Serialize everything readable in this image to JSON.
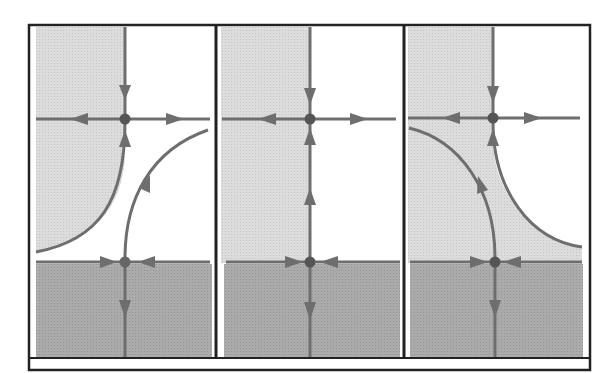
{
  "figure": {
    "type": "phase-portrait-panels",
    "panel_count": 3,
    "colors": {
      "background": "#ffffff",
      "frame": "#222222",
      "light_region": "#d9d9d9",
      "dark_region": "#a8a8a8",
      "flow_line": "#6e6e6e",
      "fixed_point": "#555555"
    }
  },
  "panels": [
    {
      "id": "left",
      "x0": 35,
      "x1": 213,
      "top": 27,
      "bottom": 357,
      "upper_node": {
        "x": 125,
        "y": 119
      },
      "lower_node": {
        "x": 125,
        "y": 262
      },
      "light_region_shape": "left-cusp",
      "separatrix_curves": [
        {
          "from": "lower-left",
          "to": "upper-node",
          "direction": "into-node"
        },
        {
          "from": "lower-node",
          "to": "upper-right",
          "direction": "out-of-node"
        }
      ]
    },
    {
      "id": "middle",
      "x0": 221,
      "x1": 400,
      "top": 27,
      "bottom": 357,
      "upper_node": {
        "x": 310,
        "y": 119
      },
      "lower_node": {
        "x": 310,
        "y": 262
      },
      "light_region_shape": "left-half-rectangle",
      "separatrix_curves": [
        {
          "from": "lower-node",
          "to": "upper-node",
          "direction": "heteroclinic-straight"
        }
      ]
    },
    {
      "id": "right",
      "x0": 407,
      "x1": 584,
      "top": 27,
      "bottom": 357,
      "upper_node": {
        "x": 493,
        "y": 118
      },
      "lower_node": {
        "x": 495,
        "y": 262
      },
      "light_region_shape": "right-cusp",
      "separatrix_curves": [
        {
          "from": "lower-node",
          "to": "upper-left",
          "direction": "out-of-node"
        },
        {
          "from": "lower-right",
          "to": "upper-node",
          "direction": "into-node"
        }
      ]
    }
  ]
}
